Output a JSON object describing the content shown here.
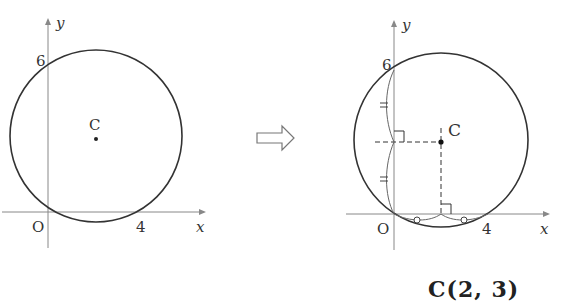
{
  "left_figure": {
    "y_axis_label": "y",
    "x_axis_label": "x",
    "origin_label": "O",
    "y_intercept_label": "6",
    "x_intercept_label": "4",
    "center_label": "C"
  },
  "arrow": {
    "icon": "right-hollow-arrow-icon"
  },
  "right_figure": {
    "y_axis_label": "y",
    "x_axis_label": "x",
    "origin_label": "O",
    "y_intercept_label": "6",
    "x_intercept_label": "4",
    "center_label": "C"
  },
  "result_label": "C(2, 3)",
  "colors": {
    "stroke": "#333333",
    "background": "#ffffff"
  }
}
